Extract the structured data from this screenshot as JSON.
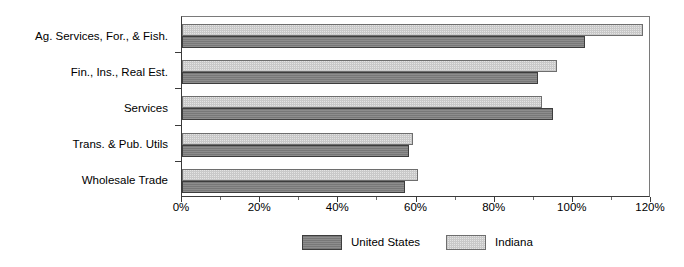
{
  "chart_data": {
    "type": "bar",
    "orientation": "horizontal",
    "title": "",
    "xlabel": "",
    "ylabel": "",
    "xlim": [
      0,
      120
    ],
    "xtick_labels": [
      "0%",
      "20%",
      "40%",
      "60%",
      "80%",
      "100%",
      "120%"
    ],
    "xtick_values": [
      0,
      20,
      40,
      60,
      80,
      100,
      120
    ],
    "minor_tick_step": 10,
    "grid": false,
    "legend_position": "bottom-center",
    "categories": [
      "Ag. Services, For., & Fish.",
      "Fin., Ins., Real Est.",
      "Services",
      "Trans. & Pub. Utils",
      "Wholesale Trade"
    ],
    "series": [
      {
        "name": "United States",
        "color": "#808080",
        "pattern": "solid-gray",
        "values": [
          103,
          91,
          95,
          58,
          57
        ]
      },
      {
        "name": "Indiana",
        "color": "#e4e4e4",
        "pattern": "light-dotted",
        "values": [
          118,
          96,
          92,
          59,
          60.5
        ]
      }
    ]
  },
  "legend": {
    "items": [
      {
        "label": "United States",
        "swatch": "us"
      },
      {
        "label": "Indiana",
        "swatch": "in"
      }
    ]
  }
}
